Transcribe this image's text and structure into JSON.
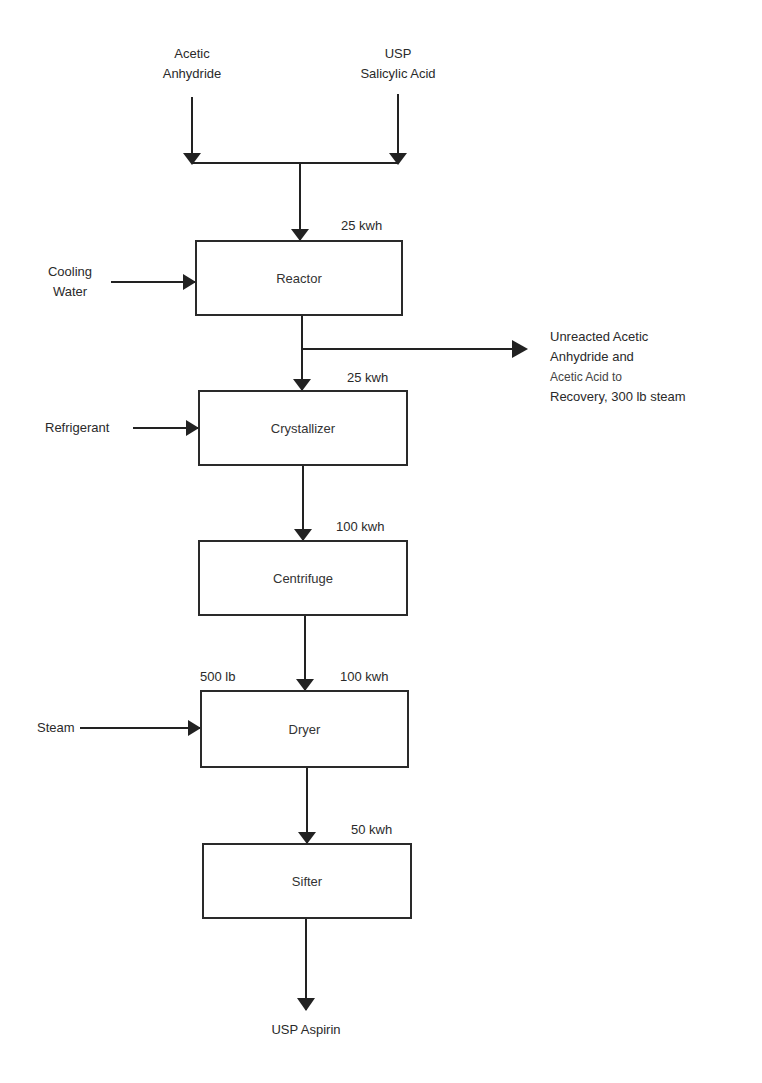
{
  "diagram": {
    "title": "",
    "inputs": {
      "acetic_anhydride": [
        "Acetic",
        "Anhydride"
      ],
      "salicylic_acid": [
        "USP",
        "Salicylic Acid"
      ],
      "cooling_water": [
        "Cooling",
        "Water"
      ],
      "refrigerant": "Refrigerant",
      "steam": "Steam"
    },
    "units": [
      {
        "id": "reactor",
        "label": "Reactor",
        "energy": "25 kwh"
      },
      {
        "id": "crystallizer",
        "label": "Crystallizer",
        "energy": "25 kwh"
      },
      {
        "id": "centrifuge",
        "label": "Centrifuge",
        "energy": "100 kwh"
      },
      {
        "id": "dryer",
        "label": "Dryer",
        "energy": "100 kwh",
        "steam_amount": "500 lb"
      },
      {
        "id": "sifter",
        "label": "Sifter",
        "energy": "50 kwh"
      }
    ],
    "side_output": [
      "Unreacted Acetic",
      "Anhydride and",
      "Acetic Acid to",
      "Recovery, 300 lb steam"
    ],
    "product": "USP Aspirin"
  }
}
